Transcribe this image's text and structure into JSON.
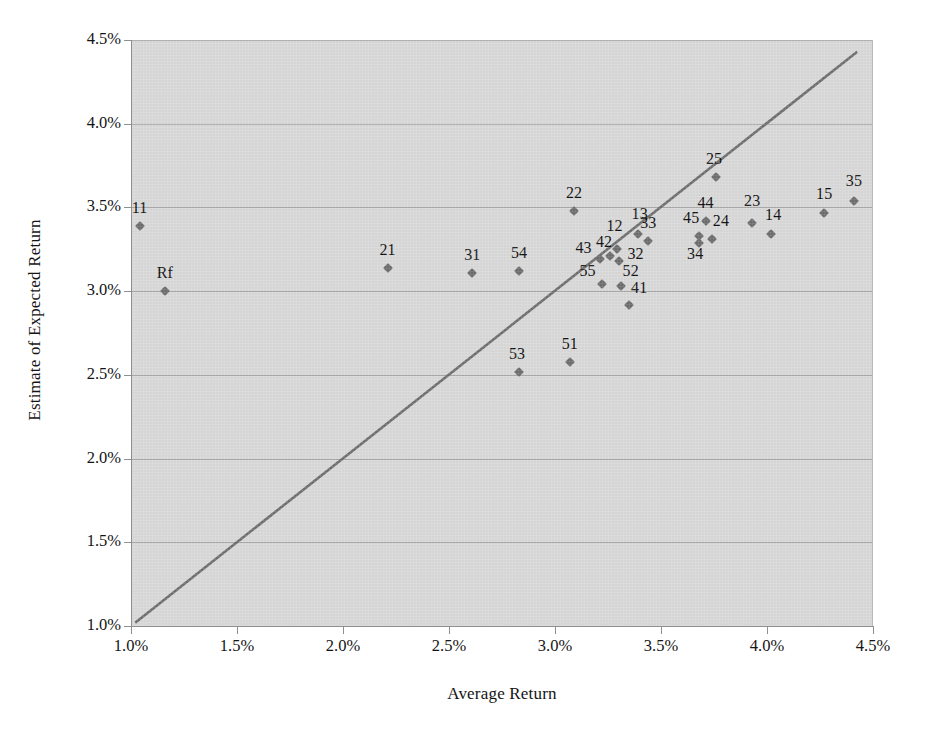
{
  "chart_data": {
    "type": "scatter",
    "title": "",
    "xlabel": "Average Return",
    "ylabel": "Estimate of Expected Return",
    "xlim": [
      1.0,
      4.5
    ],
    "ylim": [
      1.0,
      4.5
    ],
    "xticks": [
      "1.0%",
      "1.5%",
      "2.0%",
      "2.5%",
      "3.0%",
      "3.5%",
      "4.0%",
      "4.5%"
    ],
    "xtick_values": [
      1.0,
      1.5,
      2.0,
      2.5,
      3.0,
      3.5,
      4.0,
      4.5
    ],
    "yticks": [
      "1.0%",
      "1.5%",
      "2.0%",
      "2.5%",
      "3.0%",
      "3.5%",
      "4.0%",
      "4.5%"
    ],
    "ytick_values": [
      1.0,
      1.5,
      2.0,
      2.5,
      3.0,
      3.5,
      4.0,
      4.5
    ],
    "grid": "horizontal",
    "legend": "none",
    "units": "percent",
    "reference_line": {
      "name": "identity-line",
      "type": "line",
      "slope": 1,
      "intercept": 0,
      "x_start": 1.02,
      "y_start": 1.02,
      "x_end": 4.43,
      "y_end": 4.43,
      "color": "#6f6f6f"
    },
    "marker_color": "#6e6e6e",
    "marker_shape": "diamond",
    "points": [
      {
        "label": "11",
        "x": 1.04,
        "y": 3.39,
        "label_dx": 0,
        "label_dy": -9
      },
      {
        "label": "Rf",
        "x": 1.16,
        "y": 3.0,
        "label_dx": 0,
        "label_dy": -9
      },
      {
        "label": "21",
        "x": 2.21,
        "y": 3.14,
        "label_dx": 0,
        "label_dy": -9
      },
      {
        "label": "31",
        "x": 2.61,
        "y": 3.11,
        "label_dx": 0,
        "label_dy": -9
      },
      {
        "label": "54",
        "x": 2.83,
        "y": 3.12,
        "label_dx": 0,
        "label_dy": -9
      },
      {
        "label": "53",
        "x": 2.83,
        "y": 2.52,
        "label_dx": -2,
        "label_dy": -9
      },
      {
        "label": "51",
        "x": 3.07,
        "y": 2.58,
        "label_dx": 0,
        "label_dy": -9
      },
      {
        "label": "22",
        "x": 3.09,
        "y": 3.48,
        "label_dx": 0,
        "label_dy": -9
      },
      {
        "label": "43",
        "x": 3.21,
        "y": 3.19,
        "label_dx": -16,
        "label_dy": -2
      },
      {
        "label": "55",
        "x": 3.22,
        "y": 3.04,
        "label_dx": -14,
        "label_dy": -4
      },
      {
        "label": "42",
        "x": 3.26,
        "y": 3.21,
        "label_dx": -6,
        "label_dy": -5
      },
      {
        "label": "12",
        "x": 3.29,
        "y": 3.25,
        "label_dx": -2,
        "label_dy": -14
      },
      {
        "label": "32",
        "x": 3.3,
        "y": 3.18,
        "label_dx": 17,
        "label_dy": 2
      },
      {
        "label": "52",
        "x": 3.31,
        "y": 3.03,
        "label_dx": 10,
        "label_dy": -6
      },
      {
        "label": "41",
        "x": 3.35,
        "y": 2.92,
        "label_dx": 10,
        "label_dy": -8
      },
      {
        "label": "13",
        "x": 3.39,
        "y": 3.34,
        "label_dx": 2,
        "label_dy": -11
      },
      {
        "label": "33",
        "x": 3.44,
        "y": 3.3,
        "label_dx": 0,
        "label_dy": -9
      },
      {
        "label": "45",
        "x": 3.68,
        "y": 3.33,
        "label_dx": -8,
        "label_dy": -9
      },
      {
        "label": "34",
        "x": 3.68,
        "y": 3.29,
        "label_dx": -4,
        "label_dy": 20
      },
      {
        "label": "44",
        "x": 3.71,
        "y": 3.42,
        "label_dx": 0,
        "label_dy": -9
      },
      {
        "label": "24",
        "x": 3.74,
        "y": 3.31,
        "label_dx": 9,
        "label_dy": -9
      },
      {
        "label": "25",
        "x": 3.76,
        "y": 3.68,
        "label_dx": -2,
        "label_dy": -9
      },
      {
        "label": "23",
        "x": 3.93,
        "y": 3.41,
        "label_dx": 0,
        "label_dy": -13
      },
      {
        "label": "14",
        "x": 4.02,
        "y": 3.34,
        "label_dx": 2,
        "label_dy": -10
      },
      {
        "label": "15",
        "x": 4.27,
        "y": 3.47,
        "label_dx": 0,
        "label_dy": -10
      },
      {
        "label": "35",
        "x": 4.41,
        "y": 3.54,
        "label_dx": 0,
        "label_dy": -11
      }
    ]
  }
}
